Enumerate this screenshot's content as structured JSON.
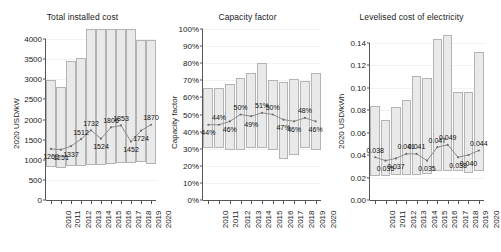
{
  "figure": {
    "width": 493,
    "height": 252,
    "background": "#ffffff",
    "bar_fill": "#e9e9e9",
    "bar_stroke": "#b4b4b4",
    "line_color": "#8c8c8c",
    "axis_color": "#555555"
  },
  "chart_data": [
    {
      "type": "bar",
      "title": "Total installed cost",
      "xlabel": "",
      "ylabel": "2020 USD/kW",
      "categories": [
        "2010",
        "2011",
        "2012",
        "2013",
        "2014",
        "2015",
        "2016",
        "2017",
        "2018",
        "2019",
        "2020"
      ],
      "yticks": [
        0,
        500,
        1000,
        1500,
        2000,
        2500,
        3000,
        3500,
        4000
      ],
      "ytick_labels": [
        "0",
        "500",
        "1000",
        "1500",
        "2000",
        "2500",
        "3000",
        "3500",
        "4000"
      ],
      "ylim": [
        0,
        4250
      ],
      "grid": true,
      "legend": "none",
      "series": [
        {
          "name": "range",
          "type": "range-bar",
          "low": [
            820,
            800,
            840,
            840,
            870,
            870,
            900,
            910,
            910,
            940,
            900
          ],
          "high": [
            2980,
            2800,
            3460,
            3530,
            4250,
            4250,
            4250,
            4250,
            4250,
            3980,
            3980
          ]
        },
        {
          "name": "weighted average",
          "type": "line",
          "values": [
            1269,
            1251,
            1337,
            1512,
            1732,
            1524,
            1806,
            1853,
            1452,
            1724,
            1870
          ],
          "labels": [
            "1269",
            "1251",
            "1337",
            "1512",
            "1732",
            "1524",
            "1806",
            "1853",
            "1452",
            "1724",
            "1870"
          ],
          "label_position": [
            "below",
            "below",
            "below",
            "above",
            "above",
            "below",
            "above",
            "above",
            "below",
            "below",
            "above"
          ]
        }
      ]
    },
    {
      "type": "bar",
      "title": "Capacity factor",
      "xlabel": "",
      "ylabel": "Capacity factor",
      "categories": [
        "2010",
        "2011",
        "2012",
        "2013",
        "2014",
        "2015",
        "2016",
        "2017",
        "2018",
        "2019",
        "2020"
      ],
      "yticks": [
        0,
        10,
        20,
        30,
        40,
        50,
        60,
        70,
        80,
        90,
        100
      ],
      "ytick_labels": [
        "0%",
        "10%",
        "20%",
        "30%",
        "40%",
        "50%",
        "60%",
        "70%",
        "80%",
        "90%",
        "100%"
      ],
      "ylim": [
        0,
        100
      ],
      "grid": true,
      "legend": "none",
      "series": [
        {
          "name": "range",
          "type": "range-bar",
          "low": [
            30.5,
            30.5,
            29.5,
            29.5,
            30.5,
            30.5,
            29.5,
            24.0,
            26.5,
            30.5,
            29.5
          ],
          "high": [
            65.5,
            65.5,
            68.0,
            71.5,
            74.0,
            80.0,
            70.0,
            69.0,
            70.5,
            69.5,
            74.5
          ]
        },
        {
          "name": "weighted average",
          "type": "line",
          "values": [
            44,
            44,
            46,
            50,
            49,
            51,
            50,
            47,
            46,
            48,
            46
          ],
          "labels": [
            "44%",
            "44%",
            "46%",
            "50%",
            "49%",
            "51%",
            "50%",
            "47%",
            "46%",
            "48%",
            "46%"
          ],
          "label_position": [
            "below",
            "above",
            "below",
            "above",
            "below",
            "above",
            "above",
            "below",
            "below",
            "above",
            "below"
          ]
        }
      ]
    },
    {
      "type": "bar",
      "title": "Levelised cost of electricity",
      "xlabel": "",
      "ylabel": "2020 USD/kWh",
      "categories": [
        "2010",
        "2011",
        "2012",
        "2013",
        "2014",
        "2015",
        "2016",
        "2017",
        "2018",
        "2019",
        "2020"
      ],
      "yticks": [
        0.0,
        0.02,
        0.04,
        0.06,
        0.08,
        0.1,
        0.12,
        0.14
      ],
      "ytick_labels": [
        "0.00",
        "0.02",
        "0.04",
        "0.06",
        "0.08",
        "0.10",
        "0.12",
        "0.14"
      ],
      "ylim": [
        0,
        0.152
      ],
      "grid": true,
      "legend": "none",
      "series": [
        {
          "name": "range",
          "type": "range-bar",
          "low": [
            0.0215,
            0.0215,
            0.0218,
            0.0222,
            0.0226,
            0.0228,
            0.0258,
            0.0258,
            0.026,
            0.0238,
            0.0262
          ],
          "high": [
            0.0835,
            0.0715,
            0.0828,
            0.0888,
            0.1105,
            0.1088,
            0.1435,
            0.147,
            0.0958,
            0.0962,
            0.132
          ]
        },
        {
          "name": "weighted average",
          "type": "line",
          "values": [
            0.038,
            0.035,
            0.037,
            0.041,
            0.041,
            0.035,
            0.047,
            0.049,
            0.038,
            0.04,
            0.044
          ],
          "labels": [
            "0.038",
            "0.035",
            "0.037",
            "0.041",
            "0.041",
            "0.035",
            "0.047",
            "0.049",
            "0.038",
            "0.040",
            "0.044"
          ],
          "label_position": [
            "above",
            "below",
            "below",
            "above",
            "above",
            "below",
            "above",
            "above",
            "below",
            "below",
            "above"
          ]
        }
      ]
    }
  ]
}
